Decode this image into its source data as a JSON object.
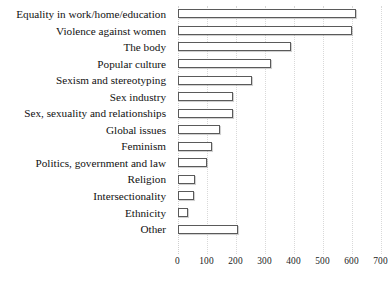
{
  "chart_data": {
    "type": "bar",
    "orientation": "horizontal",
    "title": "",
    "subtitle": "",
    "xlabel": "",
    "ylabel": "",
    "xlim": [
      0,
      700
    ],
    "xticks": [
      0,
      100,
      200,
      300,
      400,
      500,
      600,
      700
    ],
    "xtick_labels": [
      "0",
      "100",
      "200",
      "300",
      "400",
      "500",
      "600",
      "700"
    ],
    "grid": true,
    "grid_axis": "x",
    "grid_style": "dotted",
    "legend": false,
    "legend_position": "none",
    "bar_fill_color": "#ffffff",
    "bar_edge_color": "#5a5a5a",
    "grid_color": "#d9d9d9",
    "text_color": "#1a1a1a",
    "categories": [
      "Equality in work/home/education",
      "Violence against women",
      "The body",
      "Popular culture",
      "Sexism and stereotyping",
      "Sex industry",
      "Sex, sexuality and relationships",
      "Global issues",
      "Feminism",
      "Politics, government and law",
      "Religion",
      "Intersectionality",
      "Ethnicity",
      "Other"
    ],
    "values": [
      615,
      600,
      392,
      322,
      258,
      190,
      190,
      148,
      118,
      100,
      60,
      58,
      35,
      208
    ]
  }
}
